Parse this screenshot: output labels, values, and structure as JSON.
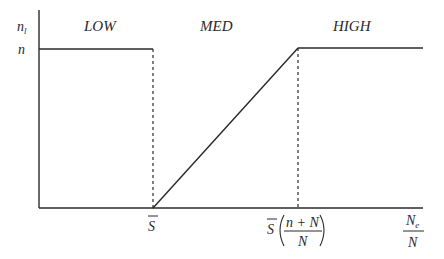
{
  "diagram": {
    "y_axis_label": "n",
    "y_axis_label_subscript": "l",
    "y_tick_label": "n",
    "regions": [
      {
        "label": "LOW"
      },
      {
        "label": "MED"
      },
      {
        "label": "HIGH"
      }
    ],
    "x_tick_1": {
      "label": "S",
      "overbar": true
    },
    "x_tick_2": {
      "prefix": "S",
      "numerator": "n + N",
      "denominator": "N"
    },
    "x_axis_label": {
      "numerator": "N",
      "numerator_subscript": "e",
      "denominator": "N"
    },
    "colors": {
      "line": "#2a2a2a",
      "background": "#ffffff"
    }
  }
}
